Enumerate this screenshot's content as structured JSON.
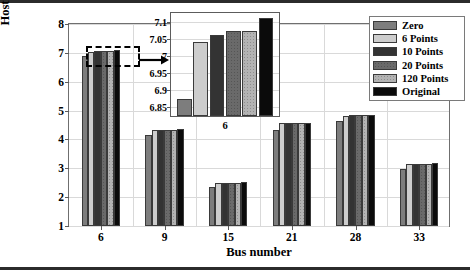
{
  "chart_data": {
    "type": "bar",
    "title": "",
    "xlabel": "Bus number",
    "ylabel": "Hosting capacity (MW)",
    "categories": [
      "6",
      "9",
      "15",
      "21",
      "28",
      "33"
    ],
    "ylim": [
      1,
      8
    ],
    "yticks": [
      1,
      2,
      3,
      4,
      5,
      6,
      7,
      8
    ],
    "grid": true,
    "legend_position": "top-right",
    "series": [
      {
        "name": "Zero",
        "color": "#7d7d7d",
        "values": [
          6.875,
          4.16,
          2.36,
          4.34,
          4.64,
          2.96
        ]
      },
      {
        "name": "6 Points",
        "color": "#cdcdcd",
        "values": [
          7.04,
          4.31,
          2.48,
          4.57,
          4.82,
          3.14
        ]
      },
      {
        "name": "10 Points",
        "color": "#333333",
        "values": [
          7.062,
          4.33,
          2.49,
          4.57,
          4.83,
          3.16
        ]
      },
      {
        "name": "20 Points",
        "color": "#6a6a6a",
        "values": [
          7.072,
          4.33,
          2.49,
          4.57,
          4.83,
          3.16
        ]
      },
      {
        "name": "120 Points",
        "color": "#b3b3b3",
        "values": [
          7.073,
          4.34,
          2.49,
          4.57,
          4.83,
          3.16
        ]
      },
      {
        "name": "Original",
        "color": "#0b0b0b",
        "values": [
          7.11,
          4.37,
          2.51,
          4.57,
          4.86,
          3.18
        ]
      }
    ]
  },
  "inset": {
    "xlabel": "6",
    "ylim": [
      6.825,
      7.125
    ],
    "yticks": [
      "6.85",
      "6.9",
      "6.95",
      "7",
      "7.05",
      "7.1"
    ],
    "ytick_values": [
      6.85,
      6.9,
      6.95,
      7.0,
      7.05,
      7.1
    ],
    "categories": [
      "6"
    ],
    "values": [
      6.875,
      7.04,
      7.062,
      7.072,
      7.073,
      7.11
    ]
  },
  "legend": {
    "items": [
      {
        "label": "Zero"
      },
      {
        "label": "6 Points"
      },
      {
        "label": "10 Points"
      },
      {
        "label": "20 Points"
      },
      {
        "label": "120 Points"
      },
      {
        "label": "Original"
      }
    ]
  },
  "annotations": {
    "callout": "zoom-callout-bus-6"
  }
}
